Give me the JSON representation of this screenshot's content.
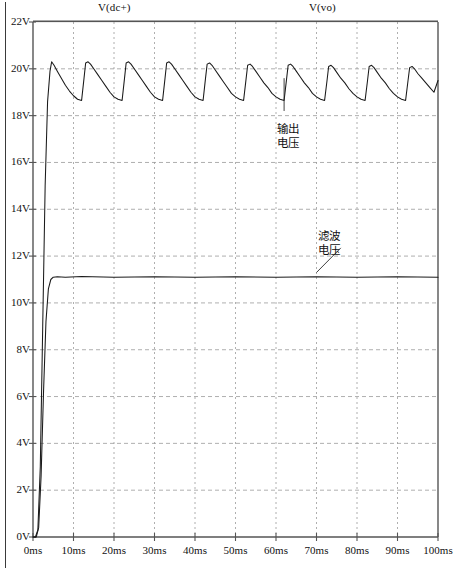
{
  "titles": {
    "left": "V(dc+)",
    "right": "V(vo)"
  },
  "annotations": {
    "output": {
      "line1": "输出",
      "line2": "电压"
    },
    "filter": {
      "line1": "滤波",
      "line2": "电压"
    }
  },
  "axes": {
    "y_ticks": [
      "22V",
      "20V",
      "18V",
      "16V",
      "14V",
      "12V",
      "10V",
      "8V",
      "6V",
      "4V",
      "2V",
      "0V"
    ],
    "x_ticks": [
      "0ms",
      "10ms",
      "20ms",
      "30ms",
      "40ms",
      "50ms",
      "60ms",
      "70ms",
      "80ms",
      "90ms",
      "100ms"
    ]
  },
  "chart_data": {
    "type": "line",
    "xlabel": "",
    "ylabel": "",
    "xlim": [
      0,
      100
    ],
    "ylim": [
      0,
      22
    ],
    "xunit": "ms",
    "yunit": "V",
    "grid": true,
    "legend": "none",
    "xticks": [
      0,
      10,
      20,
      30,
      40,
      50,
      60,
      70,
      80,
      90,
      100
    ],
    "yticks": [
      0,
      2,
      4,
      6,
      8,
      10,
      12,
      14,
      16,
      18,
      20,
      22
    ],
    "series": [
      {
        "name": "V(dc+)",
        "color": "#1a1a1a",
        "description": "Rectified sawtooth ripple rising from 0V, peaks about 20.3V, troughs about 18.7V, period 10ms",
        "x": [
          0,
          0.6,
          1.2,
          1.8,
          2.4,
          3.0,
          3.6,
          4.2,
          4.6,
          5.2,
          6.0,
          7.0,
          8.0,
          9.0,
          10.0,
          11.0,
          12.0,
          12.6,
          13.0,
          13.6,
          14.2,
          15.0,
          16.0,
          17.0,
          18.0,
          19.0,
          20.0,
          21.0,
          22.0,
          22.6,
          23.0,
          23.6,
          24.2,
          25.0,
          26.0,
          27.0,
          28.0,
          29.0,
          30.0,
          31.0,
          32.0,
          32.6,
          33.0,
          33.6,
          34.2,
          35.0,
          36.0,
          37.0,
          38.0,
          39.0,
          40.0,
          41.0,
          42.0,
          42.6,
          43.0,
          43.6,
          44.2,
          45.0,
          46.0,
          47.0,
          48.0,
          49.0,
          50.0,
          51.0,
          52.0,
          52.6,
          53.0,
          53.6,
          54.2,
          55.0,
          56.0,
          57.0,
          58.0,
          59.0,
          60.0,
          61.0,
          62.0,
          62.6,
          63.0,
          63.6,
          64.2,
          65.0,
          66.0,
          67.0,
          68.0,
          69.0,
          70.0,
          71.0,
          72.0,
          72.6,
          73.0,
          73.6,
          74.2,
          75.0,
          76.0,
          77.0,
          78.0,
          79.0,
          80.0,
          81.0,
          82.0,
          82.6,
          83.0,
          83.6,
          84.2,
          85.0,
          86.0,
          87.0,
          88.0,
          89.0,
          90.0,
          91.0,
          92.0,
          92.6,
          93.0,
          93.6,
          94.2,
          95.0,
          96.0,
          97.0,
          98.0,
          99.0,
          100.0
        ],
        "y": [
          0,
          0,
          0.3,
          3.0,
          9.0,
          15.0,
          18.6,
          19.9,
          20.3,
          20.15,
          19.9,
          19.6,
          19.3,
          19.05,
          18.85,
          18.7,
          18.65,
          19.6,
          20.25,
          20.3,
          20.2,
          20.0,
          19.75,
          19.5,
          19.25,
          19.0,
          18.8,
          18.7,
          18.65,
          19.6,
          20.25,
          20.3,
          20.2,
          20.0,
          19.75,
          19.5,
          19.25,
          19.0,
          18.8,
          18.7,
          18.65,
          19.6,
          20.25,
          20.3,
          20.2,
          20.0,
          19.75,
          19.5,
          19.25,
          19.0,
          18.8,
          18.7,
          18.65,
          19.6,
          20.2,
          20.25,
          20.15,
          19.95,
          19.7,
          19.45,
          19.2,
          18.95,
          18.8,
          18.7,
          18.65,
          19.55,
          20.15,
          20.2,
          20.1,
          19.9,
          19.65,
          19.4,
          19.2,
          18.95,
          18.8,
          18.7,
          18.65,
          19.55,
          20.15,
          20.2,
          20.1,
          19.9,
          19.65,
          19.4,
          19.2,
          18.95,
          18.8,
          18.7,
          18.65,
          19.5,
          20.1,
          20.15,
          20.05,
          19.85,
          19.6,
          19.4,
          19.15,
          18.95,
          18.8,
          18.7,
          18.65,
          19.5,
          20.1,
          20.15,
          20.05,
          19.85,
          19.6,
          19.4,
          19.15,
          18.95,
          18.8,
          18.7,
          18.65,
          19.5,
          20.05,
          20.1,
          20.0,
          19.8,
          19.6,
          19.4,
          19.2,
          19.0,
          19.5
        ]
      },
      {
        "name": "V(vo)",
        "color": "#1a1a1a",
        "description": "Filtered regulated output, fast rise then flat at about 11.1V",
        "x": [
          0,
          0.8,
          1.4,
          2.0,
          2.6,
          3.2,
          3.8,
          4.4,
          5.0,
          6.0,
          8.0,
          12.0,
          20.0,
          30.0,
          40.0,
          50.0,
          60.0,
          70.0,
          80.0,
          90.0,
          100.0
        ],
        "y": [
          0,
          0,
          0.4,
          2.6,
          6.2,
          9.2,
          10.6,
          11.0,
          11.1,
          11.12,
          11.1,
          11.13,
          11.1,
          11.12,
          11.1,
          11.12,
          11.1,
          11.12,
          11.1,
          11.12,
          11.1
        ]
      }
    ],
    "annotations": [
      {
        "text": "输出电压",
        "points_to_series": "V(dc+)",
        "x": 62,
        "y": 18
      },
      {
        "text": "滤波电压",
        "points_to_series": "V(vo)",
        "x": 70,
        "y": 12.6
      }
    ]
  },
  "colors": {
    "trace": "#1a1a1a",
    "axis": "#555555",
    "grid": "#9a9a9a",
    "background": "#ffffff"
  }
}
